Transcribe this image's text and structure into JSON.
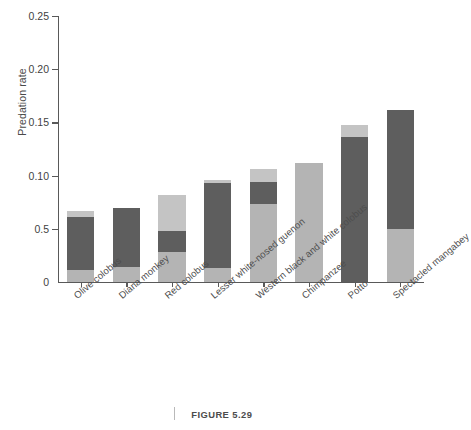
{
  "figure": {
    "caption": "FIGURE 5.29",
    "caption_rule": "vertical-rule"
  },
  "axes": {
    "ylabel": "Predation rate",
    "xlabel": "",
    "yticks": [
      {
        "value": 0.25,
        "label": "0.25"
      },
      {
        "value": 0.2,
        "label": "0.20"
      },
      {
        "value": 0.15,
        "label": "0.15"
      },
      {
        "value": 0.1,
        "label": "0.10"
      },
      {
        "value": 0.05,
        "label": "0.5"
      },
      {
        "value": 0.0,
        "label": "0"
      }
    ],
    "ylim": [
      0,
      0.25
    ],
    "grid": false
  },
  "colors": {
    "segment_light": "#b4b4b4",
    "segment_dark": "#5e5e5e",
    "segment_top": "#c4c4c4",
    "axis": "#595959",
    "text": "#3f3f3f",
    "background": "#ffffff"
  },
  "chart_data": {
    "type": "bar",
    "title": "",
    "subtitle": "",
    "xlabel": "",
    "ylabel": "Predation rate",
    "ylim": [
      0,
      0.25
    ],
    "grid": false,
    "legend_position": "none",
    "stacked": true,
    "categories": [
      "Olive colobus",
      "Diana monkey",
      "Red colobus",
      "Lesser white-nosed guenon",
      "Western black and white colobus",
      "Chimpanzee",
      "Potto",
      "Spectacled mangabey"
    ],
    "series": [
      {
        "name": "lower segment",
        "color": "#b4b4b4",
        "values": [
          0.011,
          0.014,
          0.028,
          0.013,
          0.073,
          0.112,
          0.0,
          0.05
        ]
      },
      {
        "name": "middle segment",
        "color": "#5e5e5e",
        "values": [
          0.05,
          0.056,
          0.02,
          0.08,
          0.021,
          0.0,
          0.136,
          0.112
        ]
      },
      {
        "name": "upper segment",
        "color": "#c4c4c4",
        "values": [
          0.006,
          0.0,
          0.034,
          0.003,
          0.012,
          0.0,
          0.012,
          0.0
        ]
      }
    ],
    "totals": [
      0.067,
      0.07,
      0.082,
      0.096,
      0.106,
      0.112,
      0.148,
      0.162
    ]
  }
}
